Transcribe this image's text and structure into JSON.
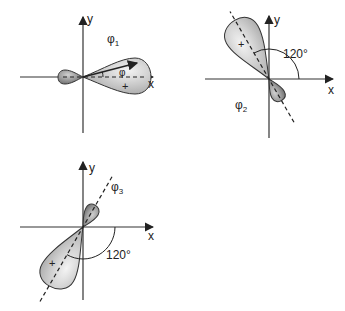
{
  "diagrams": [
    {
      "id": "phi1",
      "orbital_label": "φ",
      "orbital_subscript": "1",
      "x_axis_label": "x",
      "y_axis_label": "y",
      "angle_symbol": "φ",
      "sign_large_lobe": "+",
      "sign_small_lobe": "−",
      "direction_deg": 0
    },
    {
      "id": "phi2",
      "orbital_label": "φ",
      "orbital_subscript": "2",
      "x_axis_label": "x",
      "y_axis_label": "y",
      "angle_label": "120°",
      "sign_large_lobe": "+",
      "sign_small_lobe": "−",
      "direction_deg": 120
    },
    {
      "id": "phi3",
      "orbital_label": "φ",
      "orbital_subscript": "3",
      "x_axis_label": "x",
      "y_axis_label": "y",
      "angle_label": "120°",
      "sign_large_lobe": "+",
      "sign_small_lobe": "−",
      "direction_deg": 240
    }
  ],
  "colors": {
    "lobe_light": "#f0f0f0",
    "lobe_dark": "#a8a8a8",
    "small_lobe_dark": "#6e6e6e",
    "axis": "#333333"
  }
}
